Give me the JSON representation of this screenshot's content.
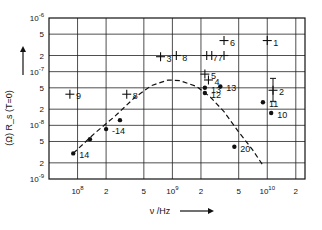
{
  "chart_data": {
    "type": "scatter",
    "title": "",
    "xlabel": "ν /Hz",
    "ylabel": "(Ω) R_s (T=0)",
    "xscale": "log",
    "yscale": "log",
    "xlim": [
      50000000.0,
      25000000000.0
    ],
    "ylim": [
      1e-09,
      1e-06
    ],
    "grid": true,
    "x_ticks": [
      {
        "value": 100000000.0,
        "label": "10^8"
      },
      {
        "value": 200000000.0,
        "label": "2"
      },
      {
        "value": 500000000.0,
        "label": "5"
      },
      {
        "value": 1000000000.0,
        "label": "10^9"
      },
      {
        "value": 2000000000.0,
        "label": "2"
      },
      {
        "value": 5000000000.0,
        "label": "5"
      },
      {
        "value": 10000000000.0,
        "label": "10^10"
      },
      {
        "value": 20000000000.0,
        "label": "2"
      }
    ],
    "y_ticks": [
      {
        "value": 1e-09,
        "label": "10^-9"
      },
      {
        "value": 2e-09,
        "label": "2"
      },
      {
        "value": 5e-09,
        "label": "5"
      },
      {
        "value": 1e-08,
        "label": "10^-8"
      },
      {
        "value": 2e-08,
        "label": "2"
      },
      {
        "value": 5e-08,
        "label": "5"
      },
      {
        "value": 1e-07,
        "label": "10^-7"
      },
      {
        "value": 2e-07,
        "label": "2"
      },
      {
        "value": 5e-07,
        "label": "5"
      },
      {
        "value": 1e-06,
        "label": "10^-6"
      }
    ],
    "series": [
      {
        "name": "crosses",
        "marker": "+",
        "points": [
          {
            "label": "1",
            "x": 10000000000.0,
            "y": 3.8e-07
          },
          {
            "label": "2",
            "x": 11500000000.0,
            "y": 4.5e-08,
            "error_y": [
              2.8e-08,
              7.5e-08
            ]
          },
          {
            "label": "3",
            "x": 750000000.0,
            "y": 1.9e-07
          },
          {
            "label": "4",
            "x": 2400000000.0,
            "y": 7e-08
          },
          {
            "label": "5",
            "x": 2200000000.0,
            "y": 9e-08
          },
          {
            "label": "6",
            "x": 3500000000.0,
            "y": 3.8e-07
          },
          {
            "label": "7",
            "x": 2300000000.0,
            "y": 2e-07
          },
          {
            "label": "7",
            "x": 2600000000.0,
            "y": 2e-07
          },
          {
            "label": "8",
            "x": 1100000000.0,
            "y": 2e-07
          },
          {
            "label": "8",
            "x": 330000000.0,
            "y": 3.8e-08
          },
          {
            "label": "9",
            "x": 83000000.0,
            "y": 3.8e-08
          },
          {
            "label": "",
            "x": 3500000000.0,
            "y": 2e-07
          }
        ]
      },
      {
        "name": "dots",
        "marker": "●",
        "points": [
          {
            "label": "10",
            "x": 11000000000.0,
            "y": 1.7e-08
          },
          {
            "label": "11",
            "x": 9000000000.0,
            "y": 2.7e-08
          },
          {
            "label": "12",
            "x": 2200000000.0,
            "y": 4e-08
          },
          {
            "label": "13",
            "x": 2200000000.0,
            "y": 5e-08
          },
          {
            "label": "13",
            "x": 3200000000.0,
            "y": 5.3e-08
          },
          {
            "label": "14",
            "x": 90000000.0,
            "y": 3e-09
          },
          {
            "label": "",
            "x": 135000000.0,
            "y": 5.5e-09
          },
          {
            "label": "-14",
            "x": 200000000.0,
            "y": 8.5e-09
          },
          {
            "label": "",
            "x": 280000000.0,
            "y": 1.25e-08
          },
          {
            "label": "20",
            "x": 4500000000.0,
            "y": 4e-09
          }
        ]
      },
      {
        "name": "fit",
        "type": "line",
        "style": "dashed",
        "x": [
          90000000.0,
          150000000.0,
          250000000.0,
          400000000.0,
          600000000.0,
          900000000.0,
          1200000000.0,
          1800000000.0,
          2500000000.0,
          3500000000.0,
          5000000000.0,
          7000000000.0,
          9000000000.0
        ],
        "y": [
          3e-09,
          7e-09,
          1.5e-08,
          3.3e-08,
          5.5e-08,
          7e-08,
          6.8e-08,
          5.3e-08,
          3.4e-08,
          1.8e-08,
          7.5e-09,
          3.5e-09,
          1.8e-09
        ]
      }
    ]
  }
}
